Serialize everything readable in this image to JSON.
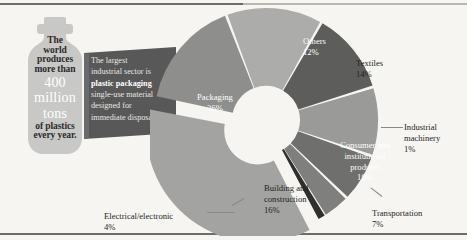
{
  "background_color": "#f6f5f1",
  "bottle": {
    "name": "plastic-bottle-silhouette",
    "fill_color": "#c8c8c6",
    "lines_top": [
      "The",
      "world",
      "produces",
      "more than"
    ],
    "highlight": [
      "400",
      "million",
      "tons"
    ],
    "lines_bottom": [
      "of plastics",
      "every year."
    ]
  },
  "callout": {
    "name": "plastic-packaging-callout",
    "fill_color": "#585858",
    "lines_before": [
      "The largest",
      "industrial sector is"
    ],
    "emphasis": "plastic packaging",
    "lines_after": [
      "single-use material",
      "designed for",
      "immediate disposal"
    ]
  },
  "chart_data": {
    "type": "pie",
    "title": "",
    "subtype": "donut",
    "exploded_slice": "Packaging",
    "units": "percent",
    "legend": "labels-on-slices",
    "categories": [
      "Packaging",
      "Building and construction",
      "Textiles",
      "Others",
      "Consumer and institutional products",
      "Transportation",
      "Electrical/electronic",
      "Industrial machinery"
    ],
    "values": [
      36,
      16,
      14,
      12,
      10,
      7,
      4,
      1
    ],
    "colors": [
      "#a3a3a1",
      "#8e8e8c",
      "#acacaa",
      "#5d5d5b",
      "#9a9a98",
      "#6f6f6d",
      "#7f7f7d",
      "#2f2f2e"
    ],
    "slices": [
      {
        "label": "Packaging",
        "pct": "36%",
        "color": "#a3a3a1"
      },
      {
        "label": "Building and construction",
        "pct": "16%",
        "color": "#8e8e8c"
      },
      {
        "label": "Textiles",
        "pct": "14%",
        "color": "#acacaa"
      },
      {
        "label": "Others",
        "pct": "12%",
        "color": "#5d5d5b"
      },
      {
        "label": "Consumer and institutional products",
        "pct": "10%",
        "color": "#9a9a98"
      },
      {
        "label": "Transportation",
        "pct": "7%",
        "color": "#6f6f6d"
      },
      {
        "label": "Electrical/electronic",
        "pct": "4%",
        "color": "#7f7f7d"
      },
      {
        "label": "Industrial machinery",
        "pct": "1%",
        "color": "#2f2f2e"
      }
    ]
  },
  "labels": {
    "packaging": {
      "name": "Packaging",
      "pct": "36%"
    },
    "others": {
      "name": "Others",
      "pct": "12%"
    },
    "textiles": {
      "name": "Textiles",
      "pct": "14%"
    },
    "indmach": {
      "name": "Industrial",
      "name2": "machinery",
      "pct": "1%"
    },
    "consumer": {
      "name": "Consumer and",
      "name2": "institutional",
      "name3": "products",
      "pct": "10%"
    },
    "transport": {
      "name": "Transportation",
      "pct": "7%"
    },
    "building": {
      "name": "Building and",
      "name2": "construction",
      "pct": "16%"
    },
    "electrical": {
      "name": "Electrical/electronic",
      "pct": "4%"
    }
  }
}
